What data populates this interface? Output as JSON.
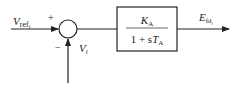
{
  "diagram": {
    "type": "control block diagram",
    "input": {
      "label": "V",
      "subscript": "ref",
      "subscript2": "i"
    },
    "summing_junction": {
      "plus_sign": "+",
      "minus_sign": "−"
    },
    "feedback": {
      "label": "V",
      "subscript": "i"
    },
    "block": {
      "numerator": {
        "symbol": "K",
        "subscript": "A"
      },
      "denominator": {
        "prefix": "1 + s",
        "symbol": "T",
        "subscript": "A"
      }
    },
    "output": {
      "label": "E",
      "subscript": "fd",
      "subscript2": "i"
    },
    "colors": {
      "line": "#222222",
      "background": "#ffffff"
    }
  }
}
